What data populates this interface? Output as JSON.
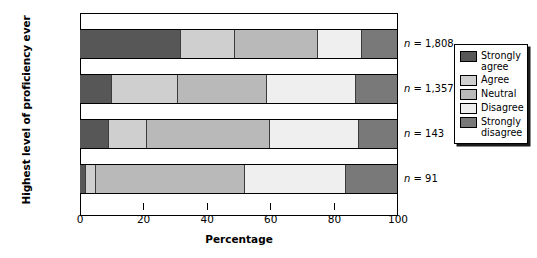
{
  "chart_data": {
    "type": "bar",
    "orientation": "horizontal",
    "stacked": true,
    "stack_mode": "percent",
    "title": "",
    "xlabel": "Percentage",
    "ylabel": "Highest level of proficiency ever",
    "xlim": [
      0,
      100
    ],
    "xticks": [
      0,
      20,
      40,
      60,
      80,
      100
    ],
    "xtick_labels": [
      "0",
      "20",
      "40",
      "60",
      "80",
      "100"
    ],
    "grid": false,
    "legend_position": "right",
    "categories": [
      "High",
      "Moderate",
      "Minimal",
      "None"
    ],
    "series": [
      {
        "name": "Strongly agree",
        "color": "#575757",
        "values": [
          32,
          10,
          9,
          2
        ]
      },
      {
        "name": "Agree",
        "color": "#cfcfcf",
        "values": [
          17,
          21,
          12,
          3
        ]
      },
      {
        "name": "Neutral",
        "color": "#b9b9b9",
        "values": [
          26,
          28,
          39,
          47
        ]
      },
      {
        "name": "Disagree",
        "color": "#efefef",
        "values": [
          14,
          28,
          28,
          32
        ]
      },
      {
        "name": "Strongly disagree",
        "color": "#797979",
        "values": [
          11,
          13,
          12,
          16
        ]
      }
    ],
    "annotations": [
      {
        "category": "High",
        "text": "n = 1,808"
      },
      {
        "category": "Moderate",
        "text": "n = 1,357"
      },
      {
        "category": "Minimal",
        "text": "n = 143"
      },
      {
        "category": "None",
        "text": "n = 91"
      }
    ]
  },
  "axis": {
    "y_title": "Highest level of proficiency ever",
    "x_title": "Percentage",
    "categories": [
      {
        "label": "High"
      },
      {
        "label": "Moderate"
      },
      {
        "label": "Minimal"
      },
      {
        "label": "None"
      }
    ],
    "ticks": [
      {
        "label": "0"
      },
      {
        "label": "20"
      },
      {
        "label": "40"
      },
      {
        "label": "60"
      },
      {
        "label": "80"
      },
      {
        "label": "100"
      }
    ]
  },
  "annotations": {
    "high": "n = 1,808",
    "moderate": "n = 1,357",
    "minimal": "n = 143",
    "none": "n = 91"
  },
  "legend": {
    "items": [
      {
        "label": "Strongly\nagree",
        "color": "#575757"
      },
      {
        "label": "Agree",
        "color": "#cfcfcf"
      },
      {
        "label": "Neutral",
        "color": "#b9b9b9"
      },
      {
        "label": "Disagree",
        "color": "#efefef"
      },
      {
        "label": "Strongly\ndisagree",
        "color": "#797979"
      }
    ]
  }
}
